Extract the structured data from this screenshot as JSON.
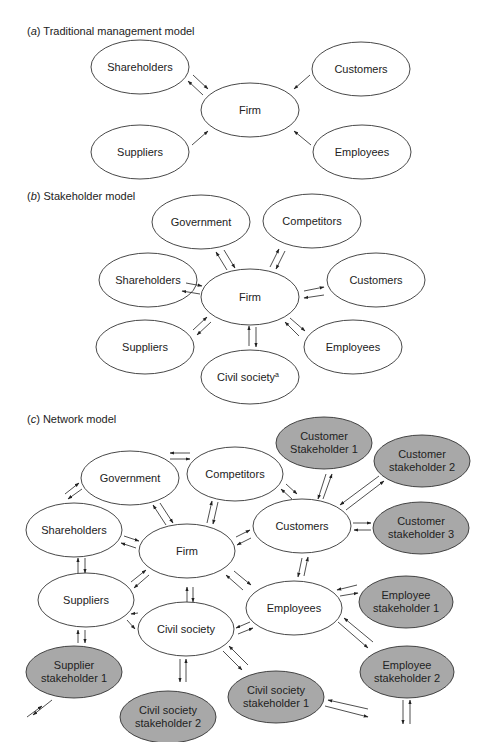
{
  "panels": [
    {
      "id": "a",
      "letter": "a",
      "title": "Traditional management model",
      "nodes": [
        {
          "id": "shareholders",
          "label": "Shareholders",
          "fill": "white"
        },
        {
          "id": "customers",
          "label": "Customers",
          "fill": "white"
        },
        {
          "id": "firm",
          "label": "Firm",
          "fill": "white"
        },
        {
          "id": "suppliers",
          "label": "Suppliers",
          "fill": "white"
        },
        {
          "id": "employees",
          "label": "Employees",
          "fill": "white"
        }
      ],
      "edges": [
        {
          "from": "shareholders",
          "to": "firm",
          "direction": "both"
        },
        {
          "from": "customers",
          "to": "firm",
          "direction": "to-firm"
        },
        {
          "from": "suppliers",
          "to": "firm",
          "direction": "to-firm"
        },
        {
          "from": "employees",
          "to": "firm",
          "direction": "to-firm"
        }
      ]
    },
    {
      "id": "b",
      "letter": "b",
      "title": "Stakeholder model",
      "nodes": [
        {
          "id": "government",
          "label": "Government",
          "fill": "white"
        },
        {
          "id": "competitors",
          "label": "Competitors",
          "fill": "white"
        },
        {
          "id": "shareholders",
          "label": "Shareholders",
          "fill": "white"
        },
        {
          "id": "firm",
          "label": "Firm",
          "fill": "white"
        },
        {
          "id": "customers",
          "label": "Customers",
          "fill": "white"
        },
        {
          "id": "suppliers",
          "label": "Suppliers",
          "fill": "white"
        },
        {
          "id": "employees",
          "label": "Employees",
          "fill": "white"
        },
        {
          "id": "civil_society",
          "label": "Civil society",
          "superscript": "a",
          "fill": "white"
        }
      ],
      "edges": [
        {
          "from": "firm",
          "to": "government",
          "direction": "both"
        },
        {
          "from": "firm",
          "to": "competitors",
          "direction": "both"
        },
        {
          "from": "firm",
          "to": "shareholders",
          "direction": "both"
        },
        {
          "from": "firm",
          "to": "customers",
          "direction": "both"
        },
        {
          "from": "firm",
          "to": "suppliers",
          "direction": "both"
        },
        {
          "from": "firm",
          "to": "employees",
          "direction": "both"
        },
        {
          "from": "firm",
          "to": "civil_society",
          "direction": "both"
        }
      ]
    },
    {
      "id": "c",
      "letter": "c",
      "title": "Network model",
      "nodes": [
        {
          "id": "customer_sh1",
          "label_lines": [
            "Customer",
            "Stakeholder 1"
          ],
          "fill": "gray"
        },
        {
          "id": "customer_sh2",
          "label_lines": [
            "Customer",
            "stakeholder 2"
          ],
          "fill": "gray"
        },
        {
          "id": "government",
          "label": "Government",
          "fill": "white"
        },
        {
          "id": "competitors",
          "label": "Competitors",
          "fill": "white"
        },
        {
          "id": "shareholders",
          "label": "Shareholders",
          "fill": "white"
        },
        {
          "id": "customers",
          "label": "Customers",
          "fill": "white"
        },
        {
          "id": "customer_sh3",
          "label_lines": [
            "Customer",
            "stakeholder 3"
          ],
          "fill": "gray"
        },
        {
          "id": "firm",
          "label": "Firm",
          "fill": "white"
        },
        {
          "id": "suppliers",
          "label": "Suppliers",
          "fill": "white"
        },
        {
          "id": "employee_sh1",
          "label_lines": [
            "Employee",
            "stakeholder 1"
          ],
          "fill": "gray"
        },
        {
          "id": "employees",
          "label": "Employees",
          "fill": "white"
        },
        {
          "id": "civil_society",
          "label": "Civil society",
          "fill": "white"
        },
        {
          "id": "supplier_sh1",
          "label_lines": [
            "Supplier",
            "stakeholder 1"
          ],
          "fill": "gray"
        },
        {
          "id": "employee_sh2",
          "label_lines": [
            "Employee",
            "stakeholder 2"
          ],
          "fill": "gray"
        },
        {
          "id": "civil_sh2",
          "label_lines": [
            "Civil society",
            "stakeholder 2"
          ],
          "fill": "gray"
        },
        {
          "id": "civil_sh1",
          "label_lines": [
            "Civil society",
            "stakeholder 1"
          ],
          "fill": "gray"
        }
      ],
      "edges": [
        {
          "from": "government",
          "to": "competitors",
          "direction": "both"
        },
        {
          "from": "government",
          "to": "shareholders",
          "direction": "both"
        },
        {
          "from": "government",
          "to": "firm",
          "direction": "both"
        },
        {
          "from": "competitors",
          "to": "firm",
          "direction": "both"
        },
        {
          "from": "competitors",
          "to": "customers",
          "direction": "both"
        },
        {
          "from": "shareholders",
          "to": "firm",
          "direction": "both"
        },
        {
          "from": "shareholders",
          "to": "suppliers",
          "direction": "both"
        },
        {
          "from": "firm",
          "to": "customers",
          "direction": "both"
        },
        {
          "from": "firm",
          "to": "suppliers",
          "direction": "both"
        },
        {
          "from": "firm",
          "to": "civil_society",
          "direction": "both"
        },
        {
          "from": "firm",
          "to": "employees",
          "direction": "both"
        },
        {
          "from": "customers",
          "to": "customer_sh1",
          "direction": "both"
        },
        {
          "from": "customers",
          "to": "customer_sh2",
          "direction": "both"
        },
        {
          "from": "customers",
          "to": "customer_sh3",
          "direction": "both"
        },
        {
          "from": "customers",
          "to": "employees",
          "direction": "both"
        },
        {
          "from": "employees",
          "to": "employee_sh1",
          "direction": "both"
        },
        {
          "from": "employees",
          "to": "employee_sh2",
          "direction": "both"
        },
        {
          "from": "employees",
          "to": "civil_society",
          "direction": "both"
        },
        {
          "from": "suppliers",
          "to": "civil_society",
          "direction": "both"
        },
        {
          "from": "suppliers",
          "to": "supplier_sh1",
          "direction": "both"
        },
        {
          "from": "civil_society",
          "to": "civil_sh2",
          "direction": "both"
        },
        {
          "from": "civil_society",
          "to": "civil_sh1",
          "direction": "both"
        },
        {
          "from": "supplier_sh1",
          "to": "offpage",
          "direction": "both"
        },
        {
          "from": "civil_sh1",
          "to": "offpage",
          "direction": "both"
        },
        {
          "from": "employee_sh2",
          "to": "offpage",
          "direction": "both"
        }
      ]
    }
  ],
  "colors": {
    "node_white": "#ffffff",
    "node_gray": "#a8a8a8",
    "stroke": "#333333"
  }
}
